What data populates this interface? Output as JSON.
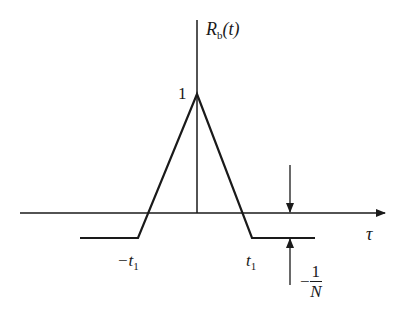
{
  "diagram": {
    "title_label": {
      "main": "R",
      "subscript": "b",
      "arg": "(t)"
    },
    "peak_label": "1",
    "x_axis_label": "τ",
    "neg_t1_label": {
      "main": "−t",
      "subscript": "1"
    },
    "pos_t1_label": {
      "main": "t",
      "subscript": "1"
    },
    "level_label": {
      "sign": "−",
      "numerator": "1",
      "denominator": "N"
    },
    "colors": {
      "stroke": "#1a1a1a",
      "background": "#ffffff"
    }
  }
}
